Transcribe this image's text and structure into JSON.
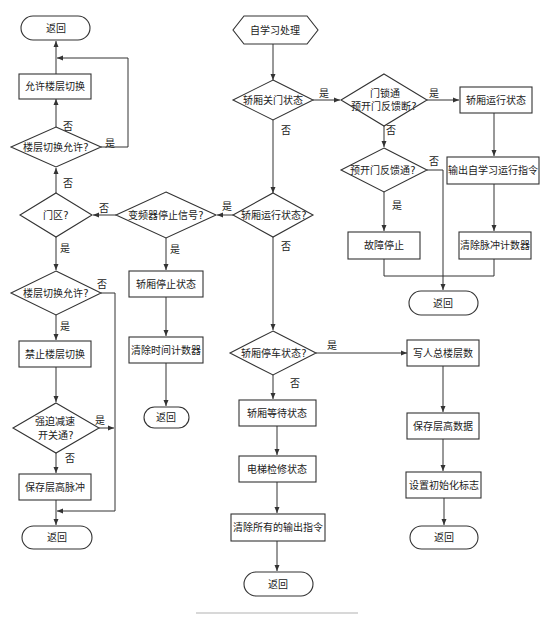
{
  "diagram": {
    "type": "flowchart",
    "start": "自学习处理",
    "nodes": {
      "start": {
        "text": "自学习处理",
        "shape": "hexagon"
      },
      "d_door_closed": {
        "text": "轿厢关门状态",
        "shape": "diamond"
      },
      "d_lock_prefb_off": {
        "line1": "门锁通",
        "line2": "预开门反馈断?",
        "shape": "diamond"
      },
      "p_car_running": {
        "text": "轿厢运行状态",
        "shape": "process"
      },
      "p_output_learn_cmd": {
        "text": "输出自学习运行指令",
        "shape": "process"
      },
      "p_clear_pulse": {
        "text": "清除脉冲计数器",
        "shape": "process"
      },
      "d_prefb_on": {
        "text": "预开门反馈通?",
        "shape": "diamond"
      },
      "p_fault_stop": {
        "text": "故障停止",
        "shape": "process"
      },
      "ret_top_right": {
        "text": "返回",
        "shape": "terminal"
      },
      "d_car_running": {
        "text": "轿厢运行状态?",
        "shape": "diamond"
      },
      "d_inverter_stop": {
        "text": "变频器停止信号?",
        "shape": "diamond"
      },
      "p_car_stop_state": {
        "text": "轿厢停止状态",
        "shape": "process"
      },
      "p_clear_timer": {
        "text": "清除时间计数器",
        "shape": "process"
      },
      "ret_mid": {
        "text": "返回",
        "shape": "terminal"
      },
      "d_door_zone": {
        "text": "门区?",
        "shape": "diamond"
      },
      "d_floor_switch_top": {
        "text": "楼层切换允许?",
        "shape": "diamond"
      },
      "p_allow_floor_switch": {
        "text": "允许楼层切换",
        "shape": "process"
      },
      "ret_top_left": {
        "text": "返回",
        "shape": "terminal"
      },
      "d_floor_switch_bottom": {
        "text": "楼层切换允许?",
        "shape": "diamond"
      },
      "p_forbid_floor_switch": {
        "text": "禁止楼层切换",
        "shape": "process"
      },
      "d_forced_decel": {
        "line1": "强迫减速",
        "line2": "开关通?",
        "shape": "diamond"
      },
      "p_save_floor_pulse": {
        "text": "保存层高脉冲",
        "shape": "process"
      },
      "ret_bottom_left": {
        "text": "返回",
        "shape": "terminal"
      },
      "d_car_parked": {
        "text": "轿厢停车状态?",
        "shape": "diamond"
      },
      "p_car_waiting": {
        "text": "轿厢等待状态",
        "shape": "process"
      },
      "p_maintenance": {
        "text": "电梯检修状态",
        "shape": "process"
      },
      "p_clear_all_outputs": {
        "text": "清除所有的输出指令",
        "shape": "process"
      },
      "ret_bottom_center": {
        "text": "返回",
        "shape": "terminal"
      },
      "p_write_total_floors": {
        "text": "写人总楼层数",
        "shape": "process"
      },
      "p_save_floor_height": {
        "text": "保存层高数据",
        "shape": "process"
      },
      "p_set_init_flag": {
        "text": "设置初始化标志",
        "shape": "process"
      },
      "ret_bottom_right": {
        "text": "返回",
        "shape": "terminal"
      }
    },
    "edge_labels": {
      "yes": "是",
      "no": "否"
    },
    "edges": [
      {
        "from": "start",
        "to": "d_door_closed"
      },
      {
        "from": "d_door_closed",
        "to": "d_lock_prefb_off",
        "label": "是"
      },
      {
        "from": "d_door_closed",
        "to": "d_car_running",
        "label": "否"
      },
      {
        "from": "d_lock_prefb_off",
        "to": "p_car_running",
        "label": "是"
      },
      {
        "from": "d_lock_prefb_off",
        "to": "d_prefb_on",
        "label": "否"
      },
      {
        "from": "p_car_running",
        "to": "p_output_learn_cmd"
      },
      {
        "from": "p_output_learn_cmd",
        "to": "p_clear_pulse"
      },
      {
        "from": "p_clear_pulse",
        "to": "ret_top_right"
      },
      {
        "from": "d_prefb_on",
        "to": "p_fault_stop",
        "label": "是"
      },
      {
        "from": "d_prefb_on",
        "to": "ret_top_right",
        "label": "否"
      },
      {
        "from": "p_fault_stop",
        "to": "ret_top_right"
      },
      {
        "from": "d_car_running",
        "to": "d_inverter_stop",
        "label": "是"
      },
      {
        "from": "d_car_running",
        "to": "d_car_parked",
        "label": "否"
      },
      {
        "from": "d_inverter_stop",
        "to": "p_car_stop_state",
        "label": "是"
      },
      {
        "from": "d_inverter_stop",
        "to": "d_door_zone",
        "label": "否"
      },
      {
        "from": "p_car_stop_state",
        "to": "p_clear_timer"
      },
      {
        "from": "p_clear_timer",
        "to": "ret_mid"
      },
      {
        "from": "d_door_zone",
        "to": "d_floor_switch_top",
        "label": "否"
      },
      {
        "from": "d_door_zone",
        "to": "d_floor_switch_bottom",
        "label": "是"
      },
      {
        "from": "d_floor_switch_top",
        "to": "p_allow_floor_switch",
        "label": "否"
      },
      {
        "from": "d_floor_switch_top",
        "to": "ret_top_left",
        "label": "是"
      },
      {
        "from": "p_allow_floor_switch",
        "to": "ret_top_left"
      },
      {
        "from": "d_floor_switch_bottom",
        "to": "p_forbid_floor_switch",
        "label": "是"
      },
      {
        "from": "d_floor_switch_bottom",
        "to": "ret_bottom_left",
        "label": "否"
      },
      {
        "from": "p_forbid_floor_switch",
        "to": "d_forced_decel"
      },
      {
        "from": "d_forced_decel",
        "to": "p_save_floor_pulse",
        "label": "否"
      },
      {
        "from": "d_forced_decel",
        "to": "ret_bottom_left",
        "label": "是"
      },
      {
        "from": "p_save_floor_pulse",
        "to": "ret_bottom_left"
      },
      {
        "from": "d_car_parked",
        "to": "p_write_total_floors",
        "label": "是"
      },
      {
        "from": "d_car_parked",
        "to": "p_car_waiting",
        "label": "否"
      },
      {
        "from": "p_car_waiting",
        "to": "p_maintenance"
      },
      {
        "from": "p_maintenance",
        "to": "p_clear_all_outputs"
      },
      {
        "from": "p_clear_all_outputs",
        "to": "ret_bottom_center"
      },
      {
        "from": "p_write_total_floors",
        "to": "p_save_floor_height"
      },
      {
        "from": "p_save_floor_height",
        "to": "p_set_init_flag"
      },
      {
        "from": "p_set_init_flag",
        "to": "ret_bottom_right"
      }
    ]
  },
  "colors": {
    "stroke": "#333333",
    "text": "#222222",
    "background": "#ffffff",
    "divider": "#d8d8d8"
  }
}
